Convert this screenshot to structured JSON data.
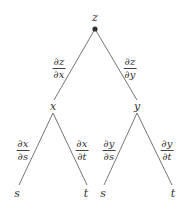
{
  "diagram": {
    "type": "tree-diagram",
    "nodes": {
      "root": {
        "label": "z"
      },
      "mid_left": {
        "label": "x"
      },
      "mid_right": {
        "label": "y"
      },
      "leaf_1": {
        "label": "s"
      },
      "leaf_2": {
        "label": "t"
      },
      "leaf_3": {
        "label": "s"
      },
      "leaf_4": {
        "label": "t"
      }
    },
    "edges": {
      "z_x": {
        "num": "∂z",
        "den": "∂x"
      },
      "z_y": {
        "num": "∂z",
        "den": "∂y"
      },
      "x_s": {
        "num": "∂x",
        "den": "∂s"
      },
      "x_t": {
        "num": "∂x",
        "den": "∂t"
      },
      "y_s": {
        "num": "∂y",
        "den": "∂s"
      },
      "y_t": {
        "num": "∂y",
        "den": "∂t"
      }
    },
    "colors": {
      "line": "#555555",
      "text": "#333333",
      "root_dot": "#333333"
    }
  }
}
